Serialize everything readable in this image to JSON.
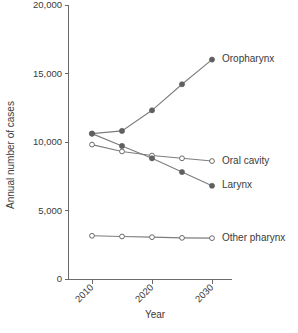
{
  "chart_data": {
    "type": "line",
    "title": "",
    "xlabel": "Year",
    "ylabel": "Annual number of cases",
    "x": [
      2010,
      2015,
      2020,
      2025,
      2030
    ],
    "xlim": [
      2008,
      2032
    ],
    "ylim": [
      0,
      20000
    ],
    "xticks": [
      2010,
      2020,
      2030
    ],
    "xticklabels": [
      "2010",
      "2020",
      "2030"
    ],
    "yticks": [
      0,
      5000,
      10000,
      15000,
      20000
    ],
    "yticklabels": [
      "0",
      "5,000",
      "10,000",
      "15,000",
      "20,000"
    ],
    "grid": false,
    "legend_position": "right-inline-labels",
    "xtick_rotation": 45,
    "series": [
      {
        "name": "Oropharynx",
        "marker": "filled-circle",
        "color": "#5f5f5f",
        "values": [
          10600,
          10800,
          12300,
          14200,
          16000
        ],
        "label_x": 2030,
        "label_y": 16000
      },
      {
        "name": "Oral cavity",
        "marker": "open-circle",
        "color": "#6a6a6a",
        "values": [
          9800,
          9300,
          9000,
          8800,
          8600
        ],
        "label_x": 2030,
        "label_y": 8600
      },
      {
        "name": "Larynx",
        "marker": "filled-circle",
        "color": "#5f5f5f",
        "values": [
          10600,
          9700,
          8800,
          7800,
          6800
        ],
        "label_x": 2030,
        "label_y": 6800
      },
      {
        "name": "Other pharynx",
        "marker": "open-circle",
        "color": "#6a6a6a",
        "values": [
          3150,
          3100,
          3050,
          3000,
          2980
        ],
        "label_x": 2030,
        "label_y": 2980
      }
    ]
  }
}
